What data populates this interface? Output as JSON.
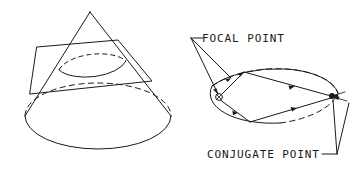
{
  "figure": {
    "background_color": "#ffffff",
    "ink_color": "#1a1a1a",
    "width": 361,
    "height": 181
  },
  "panels": [
    {
      "id": "cone-panel",
      "name": "cone-cut-by-plane",
      "description": "Right circular cone intersected by an oblique plane producing an elliptical cross-section",
      "elements": [
        "cone-apex",
        "cone-left-generator",
        "cone-right-generator",
        "cone-base-ellipse-front",
        "cone-base-ellipse-back-hidden",
        "cutting-plane-parallelogram",
        "section-ellipse-front",
        "section-ellipse-back-hidden"
      ]
    },
    {
      "id": "ellipse-panel",
      "name": "ellipse-with-focal-and-conjugate-points",
      "description": "Ellipse in perspective with rays reflecting from the focal point to the conjugate point",
      "elements": [
        "ellipse-outline",
        "focal-point-marker",
        "conjugate-point-marker",
        "ray-paths",
        "direction-arrowheads"
      ]
    }
  ],
  "labels": {
    "focal_point": {
      "text": "FOCAL POINT",
      "leader_dash_prefix": "—",
      "anchor": "left",
      "points_to": "focal-point-marker"
    },
    "conjugate_point": {
      "text": "CONJUGATE POINT",
      "leader_dash_suffix": "—",
      "anchor": "right",
      "points_to": "conjugate-point-marker"
    }
  },
  "markers": {
    "focal_point": {
      "style": "circle-with-x",
      "x": 219,
      "y": 97
    },
    "conjugate_point": {
      "style": "filled-dot",
      "x": 332,
      "y": 96
    }
  },
  "ray_count": 4,
  "arrowhead_count": 6
}
